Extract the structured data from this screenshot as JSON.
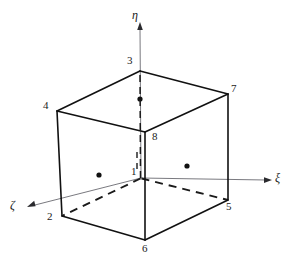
{
  "figure": {
    "type": "hexahedron-element-diagram",
    "stroke_color": "#1a1a1a",
    "axis_color": "#55555a",
    "background_color": "#ffffff"
  },
  "axes": [
    {
      "id": "xi",
      "label": "ξ",
      "label_x": 275,
      "label_y": 173,
      "origin_x": 141,
      "origin_y": 178,
      "tip_x": 269,
      "tip_y": 180,
      "dot_x": 187,
      "dot_y": 166
    },
    {
      "id": "eta",
      "label": "η",
      "label_x": 132,
      "label_y": 10,
      "origin_x": 141,
      "origin_y": 178,
      "tip_x": 140,
      "tip_y": 24,
      "dot_x": 140,
      "dot_y": 99
    },
    {
      "id": "zeta",
      "label": "ζ",
      "label_x": 11,
      "label_y": 200,
      "origin_x": 141,
      "origin_y": 178,
      "tip_x": 29,
      "tip_y": 206,
      "dot_x": 99,
      "dot_y": 175
    }
  ],
  "nodes": [
    {
      "id": "1",
      "label": "1",
      "x": 141,
      "y": 178,
      "label_x": 131,
      "label_y": 166,
      "hidden": true
    },
    {
      "id": "2",
      "label": "2",
      "x": 62,
      "y": 216,
      "label_x": 47,
      "label_y": 213,
      "hidden": false
    },
    {
      "id": "3",
      "label": "3",
      "x": 140,
      "y": 71,
      "label_x": 127,
      "label_y": 55,
      "hidden": false
    },
    {
      "id": "4",
      "label": "4",
      "x": 57,
      "y": 111,
      "label_x": 43,
      "label_y": 100,
      "hidden": false
    },
    {
      "id": "5",
      "label": "5",
      "x": 228,
      "y": 200,
      "label_x": 226,
      "label_y": 204,
      "hidden": false
    },
    {
      "id": "6",
      "label": "6",
      "x": 145,
      "y": 240,
      "label_x": 142,
      "label_y": 245,
      "hidden": false
    },
    {
      "id": "7",
      "label": "7",
      "x": 228,
      "y": 94,
      "label_x": 231,
      "label_y": 82,
      "hidden": false
    },
    {
      "id": "8",
      "label": "8",
      "x": 145,
      "y": 132,
      "label_x": 152,
      "label_y": 132,
      "hidden": false
    }
  ],
  "edges_solid": [
    {
      "from": "4",
      "to": "3"
    },
    {
      "from": "3",
      "to": "7"
    },
    {
      "from": "7",
      "to": "8"
    },
    {
      "from": "8",
      "to": "4"
    },
    {
      "from": "4",
      "to": "2"
    },
    {
      "from": "3",
      "to": "3b"
    },
    {
      "from": "7",
      "to": "5"
    },
    {
      "from": "8",
      "to": "6"
    },
    {
      "from": "2",
      "to": "6"
    },
    {
      "from": "6",
      "to": "5"
    }
  ],
  "edges_dashed": [
    {
      "from": "1",
      "to": "3"
    },
    {
      "from": "1",
      "to": "2"
    },
    {
      "from": "1",
      "to": "5"
    }
  ]
}
